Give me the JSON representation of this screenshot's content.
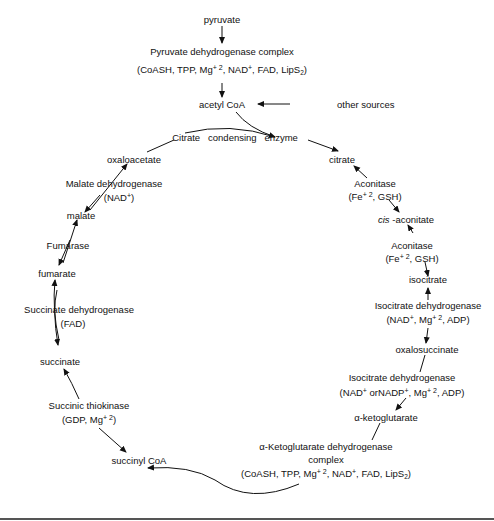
{
  "diagram": {
    "top": {
      "pyruvate": "pyruvate",
      "pdh_name": "Pyruvate dehydrogenase complex",
      "pdh_cofactors": {
        "a": "(CoASH, TPP, Mg",
        "sup1": "+ 2",
        "b": ", NAD",
        "sup2": "+",
        "c": ", FAD, LipS",
        "sub": "2",
        "d": ")"
      },
      "acetyl_coa": "acetyl CoA",
      "other_sources": "other sources",
      "citrate_enzyme": "Citrate   condensing   enzyme"
    },
    "metabolites": {
      "citrate": "citrate",
      "cis_prefix": "cis",
      "cis_aconitate": " -aconitate",
      "isocitrate": "isocitrate",
      "oxalosuccinate": "oxalosuccinate",
      "alpha_kg": "α-ketoglutarate",
      "succinyl_coa": "succinyl CoA",
      "succinate": "succinate",
      "fumarate": "fumarate",
      "malate": "malate",
      "oxaloacetate": "oxaloacetate"
    },
    "enzymes": {
      "aconitase1": {
        "name": "Aconitase",
        "cof_a": "(Fe",
        "sup": "+ 2",
        "cof_b": ", GSH)"
      },
      "aconitase2": {
        "name": "Aconitase",
        "cof_a": "(Fe",
        "sup": "+ 2",
        "cof_b": ", GSH)"
      },
      "icdh1": {
        "name": "Isocitrate dehydrogenase",
        "a": "(NAD",
        "sup1": "+",
        "b": ", Mg",
        "sup2": "+ 2",
        "c": ", ADP)"
      },
      "icdh2": {
        "name": "Isocitrate dehydrogenase",
        "a": "(NAD",
        "sup1": "+",
        "b": " orNADP",
        "sup2": "+",
        "c": ", Mg",
        "sup3": "+ 2",
        "d": ", ADP)"
      },
      "akgdh": {
        "name": "α-Ketoglutarate dehydrogenase",
        "name2": "complex",
        "a": "(CoASH, TPP, Mg",
        "sup1": "+ 2",
        "b": ", NAD",
        "sup2": "+",
        "c": ", FAD, LipS",
        "sub": "2",
        "d": ")"
      },
      "succ_thiokinase": {
        "name": "Succinic thiokinase",
        "a": "(GDP, Mg",
        "sup": "+ 2",
        "b": ")"
      },
      "sdh": {
        "name": "Succinate dehydrogenase",
        "cof": "(FAD)"
      },
      "fumarase": {
        "name": "Fumarase"
      },
      "mdh": {
        "name": "Malate dehydrogenase",
        "a": "(NAD",
        "sup": "+",
        "b": ")"
      }
    },
    "colors": {
      "line": "#111111",
      "rule": "#555555",
      "background": "#ffffff"
    }
  }
}
